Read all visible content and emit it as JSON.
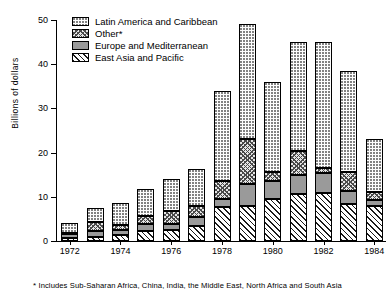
{
  "chart_data": {
    "type": "bar",
    "subtype": "stacked-bar",
    "title": "",
    "xlabel": "",
    "ylabel": "Billions of dollars",
    "ylim": [
      0,
      50
    ],
    "yticks": [
      0,
      10,
      20,
      30,
      40,
      50
    ],
    "grid": false,
    "legend_position": "top-left",
    "categories": [
      "1972",
      "1973",
      "1974",
      "1975",
      "1976",
      "1977",
      "1978",
      "1979",
      "1980",
      "1981",
      "1982",
      "1983",
      "1984"
    ],
    "xtick_labels": [
      "1972",
      "1974",
      "1976",
      "1978",
      "1980",
      "1982",
      "1984"
    ],
    "series": [
      {
        "name": "East Asia and Pacific",
        "pattern": "diagonal-hatch",
        "values": [
          0.6,
          0.9,
          1.4,
          2.3,
          2.6,
          3.4,
          7.6,
          8.0,
          9.6,
          10.6,
          10.9,
          8.3,
          7.9
        ]
      },
      {
        "name": "Europe and Mediterranean",
        "pattern": "solid-gray",
        "values": [
          1.0,
          1.3,
          1.1,
          1.5,
          1.2,
          2.1,
          1.8,
          5.0,
          4.0,
          4.3,
          4.6,
          3.1,
          1.4
        ]
      },
      {
        "name": "Other*",
        "pattern": "cross-hatch",
        "values": [
          0.3,
          2.0,
          1.2,
          1.9,
          3.0,
          2.5,
          4.1,
          10.0,
          2.1,
          5.4,
          1.0,
          4.3,
          1.8
        ]
      },
      {
        "name": "Latin America and Caribbean",
        "pattern": "stipple-dots",
        "values": [
          2.2,
          3.3,
          4.8,
          6.0,
          7.2,
          8.4,
          20.5,
          26.0,
          20.3,
          24.7,
          28.5,
          22.8,
          11.9
        ]
      }
    ],
    "totals": [
      4.1,
      7.5,
      8.5,
      11.7,
      14.0,
      16.4,
      34.0,
      49.0,
      36.0,
      45.0,
      45.0,
      38.5,
      23.0
    ],
    "legend": [
      {
        "label": "Latin America and Caribbean",
        "pattern": "stipple-dots"
      },
      {
        "label": "Other*",
        "pattern": "cross-hatch"
      },
      {
        "label": "Europe and Mediterranean",
        "pattern": "solid-gray"
      },
      {
        "label": "East Asia and Pacific",
        "pattern": "diagonal-hatch"
      }
    ],
    "footnote": "Includes Sub-Saharan Africa, China, India, the Middle East, North Africa and South Asia",
    "footnote_marker": "*"
  }
}
